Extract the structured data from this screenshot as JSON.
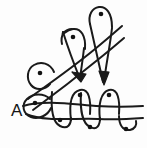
{
  "figure": {
    "title": "A",
    "caption_label": "A",
    "type": "hand-drawn knot / braid diagram",
    "width": 147,
    "height": 148,
    "background_color": "#fdfdfd",
    "ink_color": "#1a1a1a",
    "dot_color": "#121212"
  },
  "label": {
    "text": "A",
    "x": 11,
    "y": 116,
    "font_size": 17
  },
  "nodes": [
    {
      "name": "node-top-right",
      "x": 101,
      "y": 14,
      "r": 2.3
    },
    {
      "name": "node-upper-mid",
      "x": 73,
      "y": 37,
      "r": 2.3
    },
    {
      "name": "node-left-upper",
      "x": 40,
      "y": 73,
      "r": 2.3
    },
    {
      "name": "node-left-lower",
      "x": 35,
      "y": 103,
      "r": 2.3
    },
    {
      "name": "node-mid-upper",
      "x": 80,
      "y": 95,
      "r": 2.3
    },
    {
      "name": "node-mid-lower",
      "x": 60,
      "y": 120,
      "r": 2.3
    },
    {
      "name": "node-right-upper",
      "x": 109,
      "y": 95,
      "r": 2.3
    },
    {
      "name": "node-right-lower",
      "x": 90,
      "y": 127,
      "r": 2.3
    },
    {
      "name": "node-far-right",
      "x": 126,
      "y": 129,
      "r": 2.3
    }
  ],
  "loops": [
    {
      "name": "loop-top-right",
      "cx": 101,
      "cy": 22,
      "rx": 10,
      "ry": 16,
      "rotation": 12
    },
    {
      "name": "loop-upper-mid",
      "cx": 74,
      "cy": 45,
      "rx": 11,
      "ry": 17,
      "rotation": 14
    },
    {
      "name": "loop-left-upper",
      "cx": 41,
      "cy": 80,
      "rx": 12,
      "ry": 14,
      "rotation": -20
    },
    {
      "name": "loop-left-lower",
      "cx": 38,
      "cy": 105,
      "rx": 14,
      "ry": 11,
      "rotation": -15
    },
    {
      "name": "loop-mid-upper",
      "cx": 80,
      "cy": 103,
      "rx": 10,
      "ry": 16,
      "rotation": 0
    },
    {
      "name": "loop-mid-lower",
      "cx": 61,
      "cy": 112,
      "rx": 9,
      "ry": 15,
      "rotation": 0
    },
    {
      "name": "loop-right-upper",
      "cx": 109,
      "cy": 103,
      "rx": 10,
      "ry": 16,
      "rotation": 0
    },
    {
      "name": "loop-right-lower",
      "cx": 90,
      "cy": 119,
      "rx": 9,
      "ry": 15,
      "rotation": 0
    }
  ],
  "arrows": [
    {
      "name": "arrow-center-down-right",
      "tip_x": 80,
      "tip_y": 80,
      "angle": 55
    },
    {
      "name": "arrow-right-down",
      "tip_x": 103,
      "tip_y": 83,
      "angle": 83
    }
  ],
  "strands": [
    {
      "name": "strand-long-diagonal-upper",
      "description": "long diagonal from lower-left to upper-right crossing the upper loops"
    },
    {
      "name": "strand-long-diagonal-lower",
      "description": "second long diagonal forming the narrow V arrow"
    },
    {
      "name": "strand-horizontal-upper",
      "description": "upper horizontal line through the bottom serpentine"
    },
    {
      "name": "strand-horizontal-lower",
      "description": "lower horizontal line through the bottom serpentine"
    },
    {
      "name": "strand-serpentine-bottom",
      "description": "serpentine wave weaving the bottom row of loops"
    }
  ],
  "counts": {
    "nodes": 9,
    "loops": 8,
    "arrows": 2
  }
}
